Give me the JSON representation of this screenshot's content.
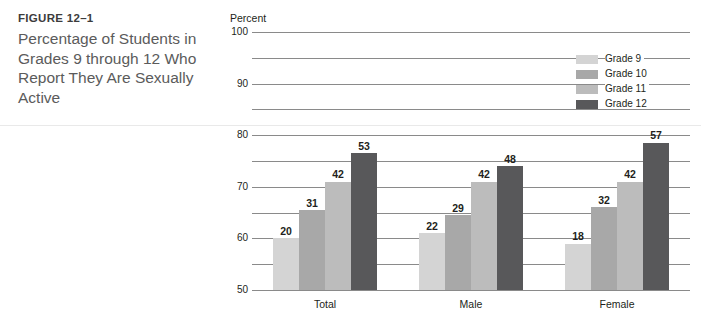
{
  "caption": {
    "figure_number": "FIGURE 12–1",
    "title": "Percentage of Students in Grades 9 through 12 Who Report They Are Sexually Active"
  },
  "chart_data": {
    "type": "bar",
    "title": "Percentage of Students in Grades 9 through 12 Who Report They Are Sexually Active",
    "xlabel": "",
    "ylabel": "Percent",
    "ylim": [
      0,
      100
    ],
    "ytick_step": 10,
    "yticks": [
      "100",
      "90",
      "80",
      "70",
      "60",
      "50",
      "40",
      "30",
      "20",
      "10",
      "0"
    ],
    "grid": true,
    "legend_position": "top-right",
    "categories": [
      "Total",
      "Male",
      "Female"
    ],
    "series": [
      {
        "name": "Grade 9",
        "color": "#d4d4d4",
        "values": [
          20,
          22,
          18
        ]
      },
      {
        "name": "Grade 10",
        "color": "#a8a8a8",
        "values": [
          31,
          29,
          32
        ]
      },
      {
        "name": "Grade 11",
        "color": "#bcbcbc",
        "values": [
          42,
          42,
          42
        ]
      },
      {
        "name": "Grade 12",
        "color": "#58585a",
        "values": [
          53,
          48,
          57
        ]
      }
    ]
  }
}
